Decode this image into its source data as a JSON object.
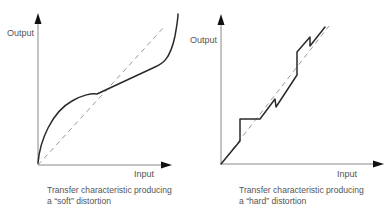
{
  "panels": [
    {
      "id": "soft",
      "y_axis_label": "Output",
      "x_axis_label": "Input",
      "caption_line1": "Transfer characteristic producing",
      "caption_line2": "a “soft” distortion",
      "curve_type": "smooth nonlinear (S-shaped) transfer curve",
      "reference_line": "dashed linear (ideal) response"
    },
    {
      "id": "hard",
      "y_axis_label": "Output",
      "x_axis_label": "Input",
      "caption_line1": "Transfer characteristic producing",
      "caption_line2": "a “hard” distortion",
      "curve_type": "piecewise linear transfer curve with abrupt steps",
      "reference_line": "dashed linear (ideal) response"
    }
  ],
  "colors": {
    "axis": "#888888",
    "curve": "#2a2a2a",
    "reference": "#9a9a9a",
    "text": "#555555"
  }
}
